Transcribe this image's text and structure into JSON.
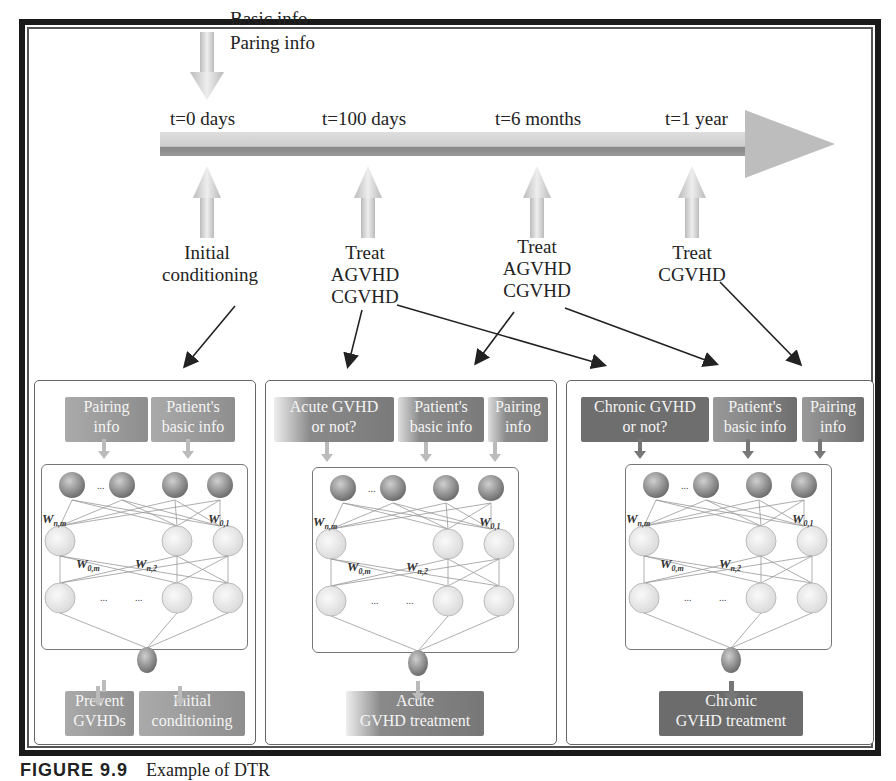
{
  "figure": {
    "caption_label": "FIGURE 9.9",
    "caption_text": "Example of DTR"
  },
  "input_arrow": {
    "line1": "Basic info",
    "line2": "Paring info"
  },
  "timeline": {
    "ticks": [
      {
        "label": "t=0 days"
      },
      {
        "label": "t=100 days"
      },
      {
        "label": "t=6 months"
      },
      {
        "label": "t=1 year"
      }
    ]
  },
  "decisions": [
    {
      "lines": [
        "Initial",
        "conditioning"
      ]
    },
    {
      "lines": [
        "Treat",
        "AGVHD",
        "CGVHD"
      ]
    },
    {
      "lines": [
        "Treat",
        "AGVHD",
        "CGVHD"
      ]
    },
    {
      "lines": [
        "Treat",
        "CGVHD"
      ]
    }
  ],
  "panels": [
    {
      "name": "initial-conditioning-model",
      "inputs": [
        {
          "lines": [
            "Pairing",
            "info"
          ]
        },
        {
          "lines": [
            "Patient's",
            "basic info"
          ]
        }
      ],
      "outputs": [
        {
          "lines": [
            "Prevent",
            "GVHDs"
          ]
        },
        {
          "lines": [
            "Initial",
            "conditioning"
          ]
        }
      ]
    },
    {
      "name": "acute-gvhd-model",
      "inputs": [
        {
          "lines": [
            "Acute GVHD",
            "or not?"
          ]
        },
        {
          "lines": [
            "Patient's",
            "basic info"
          ]
        },
        {
          "lines": [
            "Pairing",
            "info"
          ]
        }
      ],
      "outputs": [
        {
          "lines": [
            "Acute",
            "GVHD treatment"
          ]
        }
      ]
    },
    {
      "name": "chronic-gvhd-model",
      "inputs": [
        {
          "lines": [
            "Chronic GVHD",
            "or not?"
          ]
        },
        {
          "lines": [
            "Patient's",
            "basic info"
          ]
        },
        {
          "lines": [
            "Pairing",
            "info"
          ]
        }
      ],
      "outputs": [
        {
          "lines": [
            "Chronic",
            "GVHD treatment"
          ]
        }
      ]
    }
  ],
  "network_labels": {
    "w_top_left": "W",
    "w_top_left_sub": "n,m",
    "w_top_right": "W",
    "w_top_right_sub": "0,1",
    "w_mid_left": "W",
    "w_mid_left_sub": "0,m",
    "w_mid_right": "W",
    "w_mid_right_sub": "n,2",
    "ellipsis": "..."
  },
  "colors": {
    "box_light": "#9a9a9a",
    "box_dark": "#6e6e6e",
    "arrow_light": "#cfcfcf",
    "frame": "#1a1a1a"
  }
}
